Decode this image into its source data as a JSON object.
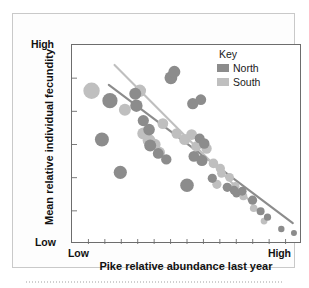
{
  "figure": {
    "background_color": "#fdfdfd",
    "frame_color": "#c9c9c9"
  },
  "legend": {
    "title": "Key",
    "position": "top-right-inside",
    "entries": [
      {
        "label": "North",
        "color": "#8c8c8c",
        "swatch_name": "legend-swatch-north"
      },
      {
        "label": "South",
        "color": "#bfbfbf",
        "swatch_name": "legend-swatch-south"
      }
    ]
  },
  "axes": {
    "y_high_label": "High",
    "y_low_label": "Low",
    "x_low_label": "Low",
    "x_high_label": "High",
    "y_title": "Mean relative individual fecundity",
    "x_title": "Pike relative abundance last year"
  },
  "chart_data": {
    "type": "scatter",
    "title": "",
    "xlabel": "Pike relative abundance last year",
    "ylabel": "Mean relative individual fecundity",
    "xlim": [
      0,
      100
    ],
    "ylim": [
      0,
      100
    ],
    "x_tick_labels": [
      "Low",
      "High"
    ],
    "y_tick_labels": [
      "Low",
      "High"
    ],
    "x_tick_count": 14,
    "y_tick_count": 6,
    "grid": false,
    "legend_position": "top-right",
    "series": [
      {
        "name": "North",
        "color": "#8c8c8c",
        "marker": "circle",
        "points": [
          {
            "x": 16.5,
            "y": 72.0,
            "size": 7.6
          },
          {
            "x": 13.0,
            "y": 52.5,
            "size": 7.0
          },
          {
            "x": 21.0,
            "y": 36.0,
            "size": 6.6
          },
          {
            "x": 27.5,
            "y": 75.5,
            "size": 6.0
          },
          {
            "x": 28.0,
            "y": 69.5,
            "size": 6.2
          },
          {
            "x": 31.0,
            "y": 62.0,
            "size": 5.6
          },
          {
            "x": 33.5,
            "y": 57.5,
            "size": 5.8
          },
          {
            "x": 34.0,
            "y": 49.5,
            "size": 6.0
          },
          {
            "x": 37.5,
            "y": 45.5,
            "size": 5.4
          },
          {
            "x": 41.0,
            "y": 42.5,
            "size": 5.2
          },
          {
            "x": 43.0,
            "y": 83.5,
            "size": 6.4
          },
          {
            "x": 44.5,
            "y": 86.5,
            "size": 6.0
          },
          {
            "x": 50.0,
            "y": 29.5,
            "size": 6.8
          },
          {
            "x": 52.5,
            "y": 70.5,
            "size": 5.6
          },
          {
            "x": 56.0,
            "y": 72.5,
            "size": 5.4
          },
          {
            "x": 55.5,
            "y": 53.0,
            "size": 5.0
          },
          {
            "x": 57.5,
            "y": 50.5,
            "size": 5.2
          },
          {
            "x": 53.0,
            "y": 44.0,
            "size": 5.4
          },
          {
            "x": 56.5,
            "y": 42.0,
            "size": 5.6
          },
          {
            "x": 61.0,
            "y": 33.0,
            "size": 4.6
          },
          {
            "x": 67.5,
            "y": 28.5,
            "size": 4.6
          },
          {
            "x": 70.5,
            "y": 27.0,
            "size": 4.4
          },
          {
            "x": 71.5,
            "y": 25.5,
            "size": 4.2
          },
          {
            "x": 74.0,
            "y": 26.5,
            "size": 4.4
          },
          {
            "x": 78.5,
            "y": 22.0,
            "size": 4.6
          },
          {
            "x": 82.0,
            "y": 16.5,
            "size": 4.0
          },
          {
            "x": 85.0,
            "y": 13.5,
            "size": 3.6
          },
          {
            "x": 91.0,
            "y": 7.5,
            "size": 3.2
          },
          {
            "x": 96.5,
            "y": 5.5,
            "size": 3.0
          }
        ]
      },
      {
        "name": "South",
        "color": "#bfbfbf",
        "marker": "circle",
        "points": [
          {
            "x": 8.5,
            "y": 77.0,
            "size": 8.2
          },
          {
            "x": 23.0,
            "y": 67.5,
            "size": 6.0
          },
          {
            "x": 29.5,
            "y": 77.0,
            "size": 6.2
          },
          {
            "x": 31.0,
            "y": 55.5,
            "size": 6.0
          },
          {
            "x": 33.5,
            "y": 52.0,
            "size": 6.4
          },
          {
            "x": 36.0,
            "y": 50.0,
            "size": 5.8
          },
          {
            "x": 38.0,
            "y": 46.0,
            "size": 5.6
          },
          {
            "x": 39.5,
            "y": 60.5,
            "size": 5.4
          },
          {
            "x": 45.5,
            "y": 55.5,
            "size": 5.2
          },
          {
            "x": 49.0,
            "y": 52.5,
            "size": 5.6
          },
          {
            "x": 52.0,
            "y": 55.0,
            "size": 5.4
          },
          {
            "x": 54.0,
            "y": 49.0,
            "size": 5.0
          },
          {
            "x": 58.5,
            "y": 48.0,
            "size": 5.2
          },
          {
            "x": 61.5,
            "y": 40.5,
            "size": 4.8
          },
          {
            "x": 64.5,
            "y": 38.0,
            "size": 4.6
          },
          {
            "x": 65.0,
            "y": 35.5,
            "size": 4.4
          },
          {
            "x": 68.5,
            "y": 33.5,
            "size": 4.4
          },
          {
            "x": 63.0,
            "y": 30.0,
            "size": 4.6
          },
          {
            "x": 71.0,
            "y": 29.0,
            "size": 4.2
          },
          {
            "x": 74.5,
            "y": 24.0,
            "size": 4.0
          },
          {
            "x": 79.0,
            "y": 18.0,
            "size": 3.8
          },
          {
            "x": 83.5,
            "y": 11.5,
            "size": 3.4
          }
        ]
      }
    ],
    "trend_lines": [
      {
        "name": "North trend",
        "color": "#8c8c8c",
        "x_start": 16.0,
        "y_start": 80.0,
        "x_end": 96.0,
        "y_end": 10.5
      },
      {
        "name": "South trend",
        "color": "#bfbfbf",
        "x_start": 18.5,
        "y_start": 90.0,
        "x_end": 77.5,
        "y_end": 21.5
      }
    ]
  }
}
